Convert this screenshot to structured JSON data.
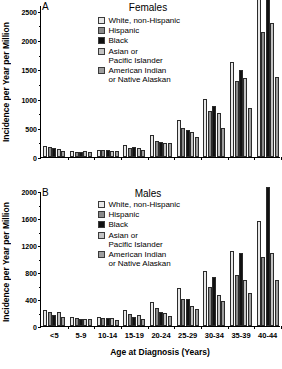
{
  "figure": {
    "xlabel": "Age at Diagnosis (Years)",
    "ylabel": "Incidence per Year per Million"
  },
  "series_names": [
    "White, non-Hispanic",
    "Hispanic",
    "Black",
    "Asian or\nPacific Islander",
    "American Indian\nor Native Alaskan"
  ],
  "series_colors": [
    "#e8e8e8",
    "#8a8a8a",
    "#111111",
    "#c3c3c3",
    "#9e9e9e"
  ],
  "panelA": {
    "letter": "A",
    "title": "Females",
    "yticks": [
      "0",
      "500",
      "1000",
      "1500",
      "2000",
      "2500"
    ]
  },
  "panelB": {
    "letter": "B",
    "title": "Males",
    "yticks": [
      "0",
      "400",
      "800",
      "1200",
      "1600",
      "2000"
    ]
  },
  "chart_data": [
    {
      "type": "bar",
      "title": "Females",
      "panel": "A",
      "xlabel": "Age at Diagnosis (Years)",
      "ylabel": "Incidence per Year per Million",
      "ylim": [
        0,
        2600
      ],
      "ytick_values": [
        0,
        500,
        1000,
        1500,
        2000,
        2500
      ],
      "grid": false,
      "legend_position": "top-center",
      "categories": [
        "<5",
        "5-9",
        "10-14",
        "15-19",
        "20-24",
        "25-29",
        "30-34",
        "35-39",
        "40-44"
      ],
      "series": [
        {
          "name": "White, non-Hispanic",
          "values": [
            180,
            95,
            125,
            210,
            385,
            625,
            995,
            1620,
            3050
          ]
        },
        {
          "name": "Hispanic",
          "values": [
            175,
            90,
            120,
            160,
            270,
            490,
            790,
            1300,
            2130
          ]
        },
        {
          "name": "Black",
          "values": [
            155,
            80,
            120,
            175,
            255,
            455,
            865,
            1490,
            3000
          ]
        },
        {
          "name": "Asian or Pacific Islander",
          "values": [
            140,
            95,
            105,
            155,
            240,
            425,
            760,
            1350,
            2300
          ]
        },
        {
          "name": "American Indian or Native Alaskan",
          "values": [
            110,
            80,
            95,
            120,
            235,
            345,
            495,
            840,
            1365
          ]
        }
      ],
      "notes": "White and Black bars in the 40-44 group extend beyond the top of the axis"
    },
    {
      "type": "bar",
      "title": "Males",
      "panel": "B",
      "xlabel": "Age at Diagnosis (Years)",
      "ylabel": "Incidence per Year per Million",
      "ylim": [
        0,
        2000
      ],
      "ytick_values": [
        0,
        400,
        800,
        1200,
        1600,
        2000
      ],
      "grid": false,
      "legend_position": "top-center",
      "categories": [
        "<5",
        "5-9",
        "10-14",
        "15-19",
        "20-24",
        "25-29",
        "30-34",
        "35-39",
        "40-44"
      ],
      "series": [
        {
          "name": "White, non-Hispanic",
          "values": [
            230,
            130,
            130,
            230,
            355,
            565,
            820,
            1105,
            1555
          ]
        },
        {
          "name": "Hispanic",
          "values": [
            210,
            120,
            125,
            175,
            260,
            395,
            585,
            755,
            1025
          ]
        },
        {
          "name": "Black",
          "values": [
            160,
            105,
            125,
            130,
            215,
            405,
            720,
            1075,
            2060
          ]
        },
        {
          "name": "Asian or Pacific Islander",
          "values": [
            205,
            110,
            115,
            160,
            195,
            290,
            465,
            685,
            1075
          ]
        },
        {
          "name": "American Indian or Native Alaskan",
          "values": [
            130,
            100,
            90,
            110,
            145,
            250,
            375,
            495,
            685
          ]
        }
      ],
      "notes": "Black bar in the 40-44 group extends beyond the top of the axis"
    }
  ]
}
